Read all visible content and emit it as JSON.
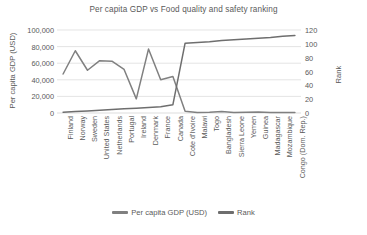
{
  "chart_data": {
    "type": "line",
    "title": "Per capita GDP vs Food quality and safety ranking",
    "xlabel": "",
    "ylabel": "Per capita GDP (USD)",
    "y2label": "Rank",
    "grid": true,
    "legend_position": "bottom",
    "ylim": [
      0,
      100000
    ],
    "y2lim": [
      0,
      120
    ],
    "yticks": [
      "0",
      "20,000",
      "40,000",
      "60,000",
      "80,000",
      "100,000"
    ],
    "ytick_values": [
      0,
      20000,
      40000,
      60000,
      80000,
      100000
    ],
    "y2ticks": [
      "0",
      "20",
      "40",
      "60",
      "80",
      "100",
      "120"
    ],
    "y2tick_values": [
      0,
      20,
      40,
      60,
      80,
      100,
      120
    ],
    "categories": [
      "Finland",
      "Norway",
      "Sweden",
      "United States",
      "Netherlands",
      "Portugal",
      "Ireland",
      "Denmark",
      "France",
      "Canada",
      "Cote d'Ivoire",
      "Malawi",
      "Togo",
      "Bangladesh",
      "Sierra Leone",
      "Yemen",
      "Guinea",
      "Madagascar",
      "Mozambique",
      "Congo (Dom. Rep.)"
    ],
    "series": [
      {
        "name": "Per capita GDP (USD)",
        "axis": "left",
        "color": "#808080",
        "values": [
          47000,
          75000,
          51500,
          63000,
          62500,
          52500,
          17000,
          77000,
          40000,
          44000,
          2200,
          600,
          900,
          1800,
          500,
          800,
          1100,
          500,
          500,
          550
        ]
      },
      {
        "name": "Rank",
        "axis": "right",
        "color": "#6e6e6e",
        "values": [
          1,
          2,
          3,
          4,
          5,
          6,
          7,
          8,
          9,
          12,
          101,
          102,
          103,
          105,
          106,
          107,
          108,
          109,
          111,
          112
        ]
      }
    ]
  },
  "legend": [
    {
      "label": "Per capita GDP (USD)",
      "color": "#808080"
    },
    {
      "label": "Rank",
      "color": "#6e6e6e"
    }
  ],
  "colors": {
    "grid": "#d9d9d9",
    "text": "#5a5a5a",
    "background": "#ffffff"
  }
}
